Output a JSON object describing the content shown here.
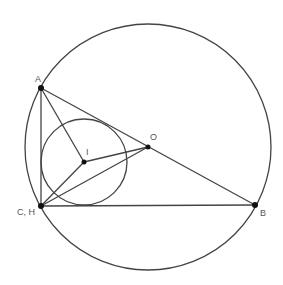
{
  "diagram": {
    "type": "geometry",
    "colors": {
      "stroke": "#444444",
      "point": "#111111",
      "label": "#555555",
      "background": "#ffffff"
    },
    "circumcircle": {
      "center": "O",
      "cx": 148,
      "cy": 147,
      "r": 123
    },
    "incircle": {
      "center": "I",
      "cx": 84,
      "cy": 162,
      "r": 43
    },
    "points": [
      {
        "id": "A",
        "label": "A",
        "x": 41,
        "y": 88,
        "dot": true
      },
      {
        "id": "CH",
        "label": "C, H",
        "x": 41,
        "y": 206,
        "dot": true
      },
      {
        "id": "B",
        "label": "B",
        "x": 255,
        "y": 205,
        "dot": true
      },
      {
        "id": "I",
        "label": "I",
        "x": 84,
        "y": 162,
        "dot": true
      },
      {
        "id": "O",
        "label": "O",
        "x": 148,
        "y": 147,
        "dot": true
      }
    ],
    "segments": [
      [
        "A",
        "CH"
      ],
      [
        "A",
        "B"
      ],
      [
        "CH",
        "B"
      ],
      [
        "A",
        "I"
      ],
      [
        "CH",
        "I"
      ],
      [
        "I",
        "O"
      ],
      [
        "CH",
        "O"
      ]
    ]
  }
}
